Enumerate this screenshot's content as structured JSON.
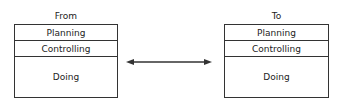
{
  "diagram": {
    "left": {
      "title": "From",
      "rows": [
        "Planning",
        "Controlling",
        "Doing"
      ]
    },
    "right": {
      "title": "To",
      "rows": [
        "Planning",
        "Controlling",
        "Doing"
      ]
    },
    "connector": "double-headed-arrow"
  }
}
